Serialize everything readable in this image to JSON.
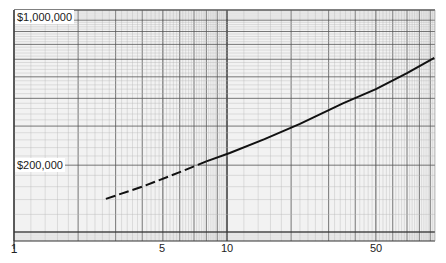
{
  "chart_data": {
    "type": "line",
    "title": "",
    "xlabel": "",
    "ylabel": "",
    "xscale": "log",
    "yscale": "log",
    "xlim": [
      1,
      95
    ],
    "ylim": [
      91000,
      1000000
    ],
    "grid": true,
    "x_tick_labels": [
      "1",
      "5",
      "10",
      "50"
    ],
    "x_ticks": [
      1,
      5,
      10,
      50
    ],
    "y_tick_labels": [
      "$1,000,000",
      "$200,000"
    ],
    "y_ticks": [
      1000000,
      200000
    ],
    "series": [
      {
        "name": "projection",
        "style": "dashed then solid (dashed below x≈8)",
        "x": [
          2.7,
          4,
          6,
          8,
          10.3,
          15,
          22,
          35,
          50,
          70,
          94
        ],
        "y": [
          141000,
          160000,
          186000,
          208000,
          227000,
          262000,
          307000,
          380000,
          440000,
          520000,
          608000
        ]
      }
    ],
    "colors": {
      "grid_minor": "#b5b5b5",
      "grid_major": "#333333",
      "line": "#111111",
      "background": "#ffffff"
    }
  },
  "labels": {
    "y_top": "$1,000,000",
    "y_mid": "$200,000",
    "x": [
      "1",
      "5",
      "10",
      "50"
    ]
  }
}
